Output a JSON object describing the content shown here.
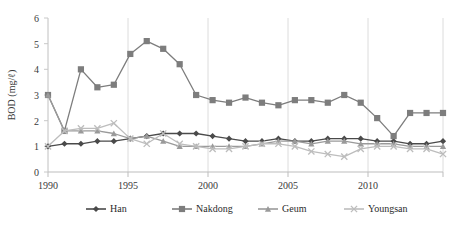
{
  "chart_data": {
    "type": "line",
    "title": "",
    "xlabel": "",
    "ylabel": "BOD (mg/ℓ)",
    "xlim": [
      1990,
      2014
    ],
    "ylim": [
      0,
      6
    ],
    "yticks": [
      0,
      1,
      2,
      3,
      4,
      5,
      6
    ],
    "xticks": [
      1990,
      1995,
      2000,
      2005,
      2010
    ],
    "grid": "vertical-major",
    "legend_position": "bottom-center",
    "x": [
      1990,
      1991,
      1992,
      1993,
      1994,
      1995,
      1996,
      1997,
      1998,
      1999,
      2000,
      2001,
      2002,
      2003,
      2004,
      2005,
      2006,
      2007,
      2008,
      2009,
      2010,
      2011,
      2012,
      2013,
      2014
    ],
    "series": [
      {
        "name": "Han",
        "marker": "diamond",
        "color": "#4a4a4a",
        "values": [
          1.0,
          1.1,
          1.1,
          1.2,
          1.2,
          1.3,
          1.4,
          1.5,
          1.5,
          1.5,
          1.4,
          1.3,
          1.2,
          1.2,
          1.3,
          1.2,
          1.2,
          1.3,
          1.3,
          1.3,
          1.2,
          1.2,
          1.1,
          1.1,
          1.2
        ]
      },
      {
        "name": "Nakdong",
        "marker": "square",
        "color": "#7d7d7d",
        "values": [
          3.0,
          1.6,
          4.0,
          3.3,
          3.4,
          4.6,
          5.1,
          4.8,
          4.2,
          3.0,
          2.8,
          2.7,
          2.9,
          2.7,
          2.6,
          2.8,
          2.8,
          2.7,
          3.0,
          2.7,
          2.1,
          1.4,
          2.3,
          2.3,
          2.3
        ]
      },
      {
        "name": "Geum",
        "marker": "triangle",
        "color": "#9a9a9a",
        "values": [
          3.0,
          1.6,
          1.6,
          1.6,
          1.5,
          1.3,
          1.4,
          1.2,
          1.0,
          1.0,
          1.0,
          1.0,
          1.0,
          1.1,
          1.2,
          1.2,
          1.1,
          1.2,
          1.2,
          1.1,
          1.1,
          1.1,
          1.0,
          1.0,
          1.0
        ]
      },
      {
        "name": "Youngsan",
        "marker": "cross",
        "color": "#bdbdbd",
        "values": [
          1.0,
          1.6,
          1.7,
          1.7,
          1.9,
          1.3,
          1.1,
          1.5,
          1.1,
          1.0,
          0.9,
          0.9,
          1.0,
          1.1,
          1.1,
          1.0,
          0.8,
          0.7,
          0.6,
          0.9,
          1.0,
          1.0,
          0.9,
          0.9,
          0.7
        ]
      }
    ]
  },
  "axes": {
    "y_title": "BOD (mg/ℓ)",
    "y_ticks": [
      "6",
      "5",
      "4",
      "3",
      "2",
      "1",
      "0"
    ],
    "x_ticks": [
      "1990",
      "1995",
      "2000",
      "2005",
      "2010"
    ]
  },
  "legend": {
    "items": [
      {
        "label": "Han",
        "marker": "diamond",
        "color": "#4a4a4a"
      },
      {
        "label": "Nakdong",
        "marker": "square",
        "color": "#7d7d7d"
      },
      {
        "label": "Geum",
        "marker": "triangle",
        "color": "#9a9a9a"
      },
      {
        "label": "Youngsan",
        "marker": "cross",
        "color": "#bdbdbd"
      }
    ]
  },
  "colors": {
    "axis": "#bfbfbf",
    "grid": "#d9d9d9",
    "text": "#3a3a3a",
    "background": "#ffffff"
  }
}
